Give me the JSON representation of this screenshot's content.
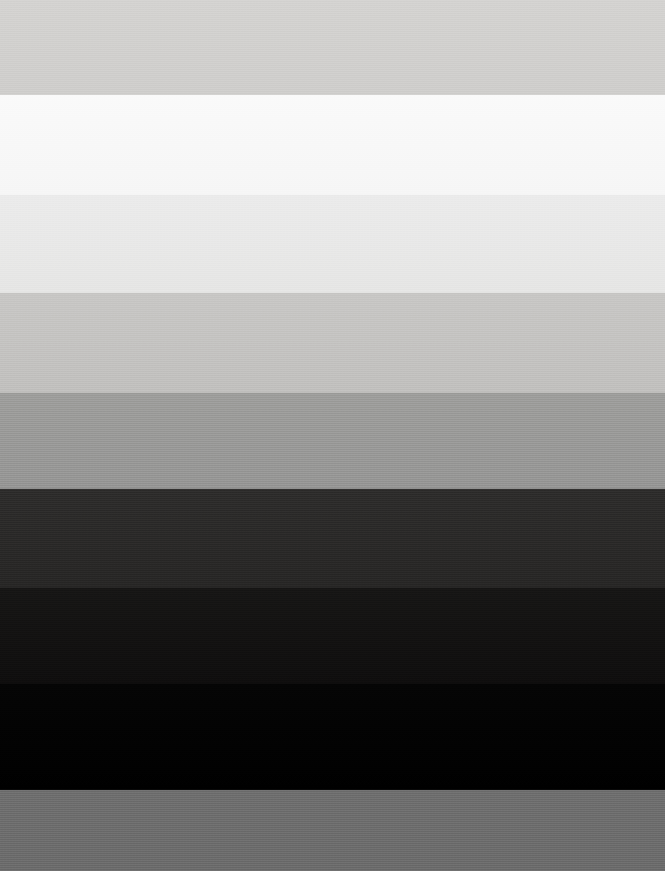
{
  "image": {
    "title": "Grayscale Step Wedge Test Pattern",
    "width": 665,
    "height": 871,
    "background_color": "#000000",
    "description": "Full-frame horizontal grayscale banding pattern with nine stacked tonal steps, no text or UI controls visible."
  },
  "chart_data": {
    "type": "bar",
    "xlabel": "",
    "ylabel": "Band",
    "grid": false,
    "legend": "none",
    "orientation": "horizontal-bands",
    "categories": [
      "Band 1",
      "Band 2",
      "Band 3",
      "Band 4",
      "Band 5",
      "Band 6",
      "Band 7",
      "Band 8",
      "Band 9"
    ],
    "values": [
      208,
      249,
      233,
      197,
      155,
      44,
      21,
      4,
      110
    ],
    "ylim": [
      0,
      255
    ]
  },
  "bands": [
    {
      "name": "band-light-gray-top",
      "index": 1,
      "label": "Band 1",
      "top": 0,
      "height": 95,
      "color_top": "#D4D3D1",
      "color_bottom": "#CFCECC",
      "luminance": 208
    },
    {
      "name": "band-near-white",
      "index": 2,
      "label": "Band 2",
      "top": 95,
      "height": 100,
      "color_top": "#FAFAFA",
      "color_bottom": "#F6F6F6",
      "luminance": 249
    },
    {
      "name": "band-very-light-gray",
      "index": 3,
      "label": "Band 3",
      "top": 195,
      "height": 98,
      "color_top": "#EBEBEB",
      "color_bottom": "#E6E6E5",
      "luminance": 233
    },
    {
      "name": "band-light-medium-gray",
      "index": 4,
      "label": "Band 4",
      "top": 293,
      "height": 100,
      "color_top": "#C8C7C5",
      "color_bottom": "#C1C0BE",
      "luminance": 197
    },
    {
      "name": "band-medium-gray",
      "index": 5,
      "label": "Band 5",
      "top": 393,
      "height": 96,
      "color_top": "#9E9E9C",
      "color_bottom": "#969695",
      "luminance": 155
    },
    {
      "name": "band-dark-charcoal",
      "index": 6,
      "label": "Band 6",
      "top": 489,
      "height": 99,
      "color_top": "#2E2D2C",
      "color_bottom": "#282726",
      "luminance": 44
    },
    {
      "name": "band-very-dark",
      "index": 7,
      "label": "Band 7",
      "top": 588,
      "height": 96,
      "color_top": "#171615",
      "color_bottom": "#0F0E0E",
      "luminance": 21
    },
    {
      "name": "band-black",
      "index": 8,
      "label": "Band 8",
      "top": 684,
      "height": 106,
      "color_top": "#050505",
      "color_bottom": "#000000",
      "luminance": 4
    },
    {
      "name": "band-mid-gray-bottom",
      "index": 9,
      "label": "Band 9",
      "top": 790,
      "height": 81,
      "color_top": "#6F6F6F",
      "color_bottom": "#6C6C6C",
      "luminance": 110
    }
  ]
}
